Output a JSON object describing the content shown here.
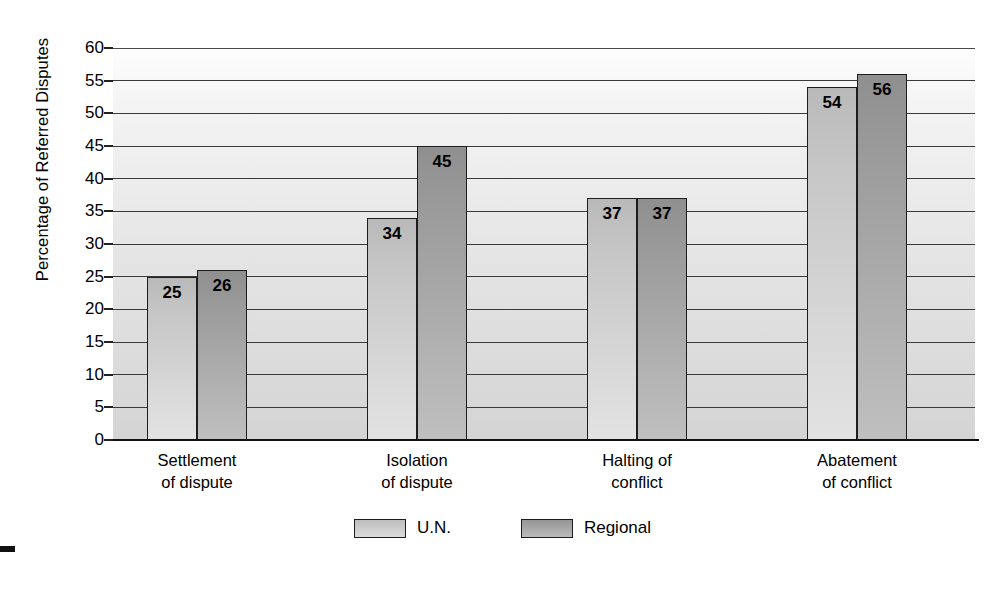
{
  "chart_data": {
    "type": "bar",
    "title": "",
    "subtitle": "",
    "xlabel": "",
    "ylabel": "Percentage of Referred Disputes",
    "ylim": [
      0,
      60
    ],
    "yticks": [
      0,
      5,
      10,
      15,
      20,
      25,
      30,
      35,
      40,
      45,
      50,
      55,
      60
    ],
    "grid": true,
    "legend_position": "bottom",
    "categories": [
      "Settlement\nof dispute",
      "Isolation\nof dispute",
      "Halting of\nconflict",
      "Abatement\nof conflict"
    ],
    "category_lines": [
      [
        "Settlement",
        "of dispute"
      ],
      [
        "Isolation",
        "of dispute"
      ],
      [
        "Halting of",
        "conflict"
      ],
      [
        "Abatement",
        "of conflict"
      ]
    ],
    "series": [
      {
        "name": "U.N.",
        "values": [
          25,
          34,
          37,
          54
        ],
        "color": "#d0d0d0"
      },
      {
        "name": "Regional",
        "values": [
          26,
          45,
          37,
          56
        ],
        "color": "#a8a8a8"
      }
    ],
    "data_labels": [
      "25",
      "26",
      "34",
      "45",
      "37",
      "37",
      "54",
      "56"
    ]
  },
  "axis": {
    "y_title": "Percentage of Referred Disputes",
    "tick_labels": [
      "60",
      "55",
      "50",
      "45",
      "40",
      "35",
      "30",
      "25",
      "20",
      "15",
      "10",
      "5",
      "0"
    ]
  },
  "legend": {
    "items": [
      {
        "label": "U.N."
      },
      {
        "label": "Regional"
      }
    ]
  }
}
